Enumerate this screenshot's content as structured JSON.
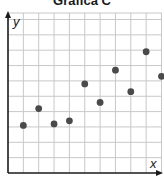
{
  "chart_data": {
    "type": "scatter",
    "title": "Gráfica C",
    "xlabel": "x",
    "ylabel": "y",
    "grid": true,
    "xlim": [
      0,
      10
    ],
    "ylim": [
      0,
      10
    ],
    "tick_labels": false,
    "points": [
      {
        "x": 1,
        "y": 3.1
      },
      {
        "x": 2,
        "y": 4.2
      },
      {
        "x": 3,
        "y": 3.2
      },
      {
        "x": 4,
        "y": 3.4
      },
      {
        "x": 5,
        "y": 5.8
      },
      {
        "x": 6,
        "y": 4.6
      },
      {
        "x": 7,
        "y": 6.7
      },
      {
        "x": 8,
        "y": 5.3
      },
      {
        "x": 9,
        "y": 7.9
      },
      {
        "x": 10,
        "y": 6.3
      }
    ],
    "colors": {
      "point": "#4a4a4a",
      "grid": "#c8c8c8",
      "axis": "#1a1a1a"
    }
  }
}
